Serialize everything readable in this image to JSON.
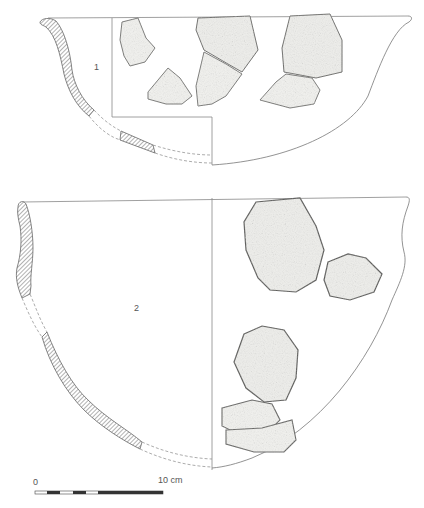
{
  "figure": {
    "type": "archaeological pottery profile drawing",
    "colors": {
      "line": "#777777",
      "hatch": "#666666",
      "sherd_fill": "#f2f2f0",
      "sherd_shadow": "#8a8a88",
      "background": "#ffffff"
    }
  },
  "vessels": [
    {
      "id": "1",
      "label": "1",
      "form": "open bowl with everted rim",
      "section_fragments": 3,
      "exterior_sherds": 6
    },
    {
      "id": "2",
      "label": "2",
      "form": "deep bowl with slightly concave upper wall",
      "section_fragments": 3,
      "exterior_sherds": 5
    }
  ],
  "scale_bar": {
    "start_label": "0",
    "end_label": "10 cm",
    "segments": 5
  },
  "caption": {
    "text": ""
  }
}
